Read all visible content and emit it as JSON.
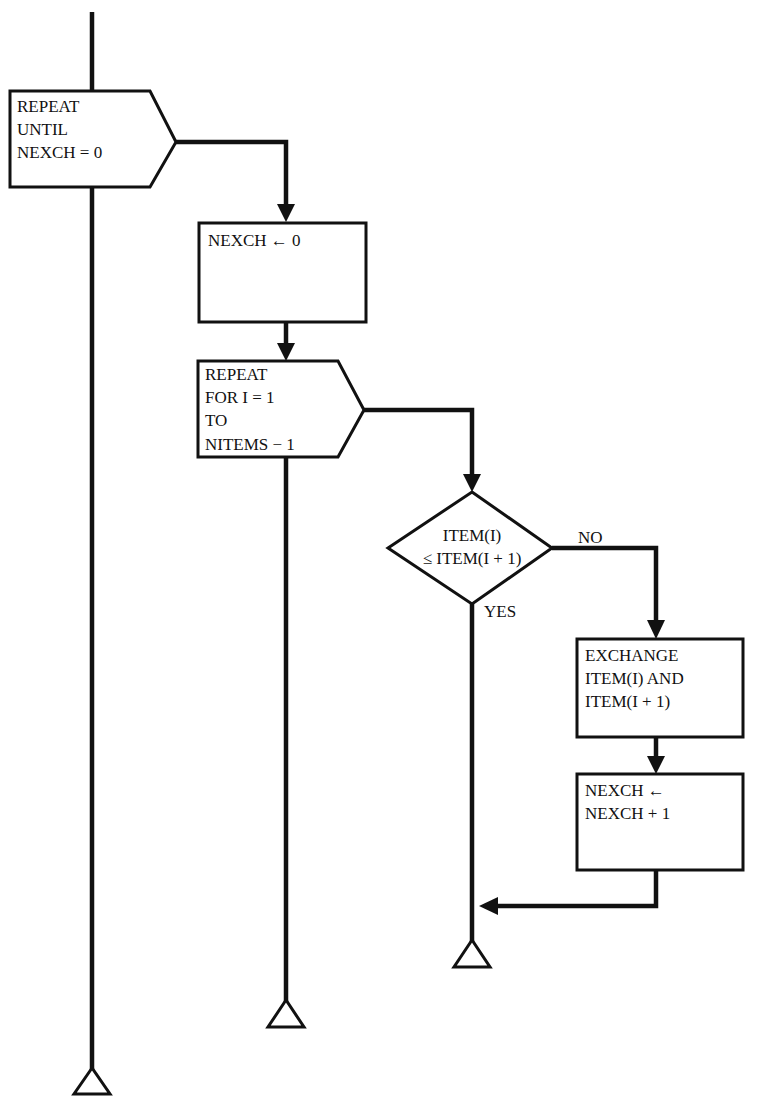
{
  "diagram": {
    "type": "structured-flowchart",
    "colors": {
      "ink": "#111111",
      "background": "#ffffff"
    },
    "outer_loop": {
      "kind": "repeat-until",
      "lines": [
        "REPEAT",
        "UNTIL",
        "NEXCH = 0"
      ]
    },
    "init_box": {
      "kind": "process",
      "lines": [
        "NEXCH ← 0"
      ]
    },
    "inner_loop": {
      "kind": "repeat-for",
      "lines": [
        "REPEAT",
        "FOR I = 1",
        "TO",
        "NITEMS − 1"
      ]
    },
    "decision": {
      "kind": "decision",
      "lines": [
        "ITEM(I)",
        "≤ ITEM(I + 1)"
      ],
      "no_label": "NO",
      "yes_label": "YES"
    },
    "exchange_box": {
      "kind": "process",
      "lines": [
        "EXCHANGE",
        "ITEM(I) AND",
        "ITEM(I + 1)"
      ]
    },
    "increment_box": {
      "kind": "process",
      "lines": [
        "NEXCH ←",
        "NEXCH + 1"
      ]
    },
    "terminators": [
      {
        "name": "decision-end",
        "symbol": "triangle"
      },
      {
        "name": "inner-loop-end",
        "symbol": "triangle"
      },
      {
        "name": "outer-loop-end",
        "symbol": "triangle"
      }
    ]
  }
}
